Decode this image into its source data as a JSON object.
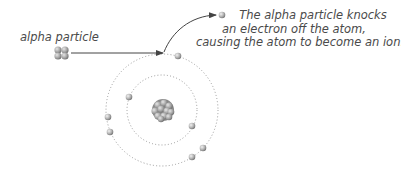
{
  "labels": {
    "alpha_particle": "alpha particle",
    "caption_lines": [
      "The alpha particle knocks",
      "an electron off the atom,",
      "causing the atom to become an ion."
    ]
  },
  "colors": {
    "text": "#4a4a4a",
    "arrow": "#444444",
    "orbit": "#9a9a9a",
    "electron": "#b0b0b0",
    "nucleus": "#a8a8a8",
    "background": "#ffffff"
  },
  "atom": {
    "center": [
      162,
      110
    ],
    "inner_orbit_radius": 35,
    "outer_orbit_radius": 56,
    "electron_count_remaining": 7,
    "ejected_electron_count": 1
  }
}
